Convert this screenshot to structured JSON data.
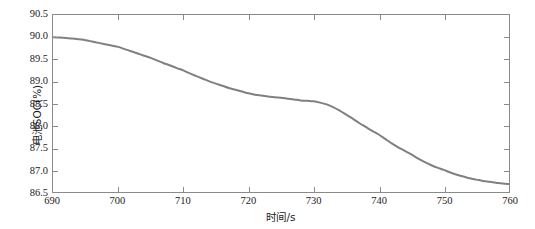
{
  "chart_data": {
    "type": "line",
    "title": "",
    "xlabel": "时间/s",
    "ylabel": "电池SOC(%)",
    "xlim": [
      690,
      760
    ],
    "ylim": [
      86.5,
      90.5
    ],
    "xticks": [
      690,
      700,
      710,
      720,
      730,
      740,
      750,
      760
    ],
    "xtick_labels": [
      "690",
      "700",
      "710",
      "720",
      "730",
      "740",
      "750",
      "760"
    ],
    "yticks": [
      86.5,
      87.0,
      87.5,
      88.0,
      88.5,
      89.0,
      89.5,
      90.0,
      90.5
    ],
    "ytick_labels": [
      "86.5",
      "87.0",
      "87.5",
      "88.0",
      "88.5",
      "89.0",
      "89.5",
      "90.0",
      "90.5"
    ],
    "grid": false,
    "legend": null,
    "legend_position": "none",
    "line_color": "#808080",
    "line_width": 2.0,
    "axis_color": "#8a8a8a",
    "background_color": "#ffffff",
    "series": [
      {
        "name": "电池SOC",
        "x": [
          690,
          691,
          692,
          693,
          694,
          695,
          696,
          697,
          698,
          699,
          700,
          701,
          702,
          703,
          704,
          705,
          706,
          707,
          708,
          709,
          710,
          711,
          712,
          713,
          714,
          715,
          716,
          717,
          718,
          719,
          720,
          721,
          722,
          723,
          724,
          725,
          726,
          727,
          728,
          729,
          730,
          731,
          732,
          733,
          734,
          735,
          736,
          737,
          738,
          739,
          740,
          741,
          742,
          743,
          744,
          745,
          746,
          747,
          748,
          749,
          750,
          751,
          752,
          753,
          754,
          755,
          756,
          757,
          758,
          759,
          760
        ],
        "y": [
          90.0,
          89.99,
          89.98,
          89.97,
          89.95,
          89.93,
          89.9,
          89.87,
          89.84,
          89.81,
          89.78,
          89.73,
          89.68,
          89.63,
          89.58,
          89.53,
          89.47,
          89.41,
          89.36,
          89.3,
          89.25,
          89.18,
          89.12,
          89.06,
          89.0,
          88.95,
          88.9,
          88.85,
          88.81,
          88.77,
          88.73,
          88.7,
          88.68,
          88.66,
          88.64,
          88.63,
          88.61,
          88.59,
          88.57,
          88.56,
          88.55,
          88.52,
          88.48,
          88.42,
          88.34,
          88.25,
          88.16,
          88.06,
          87.97,
          87.88,
          87.8,
          87.7,
          87.6,
          87.51,
          87.43,
          87.35,
          87.26,
          87.18,
          87.11,
          87.05,
          87.0,
          86.94,
          86.89,
          86.85,
          86.81,
          86.78,
          86.75,
          86.73,
          86.71,
          86.69,
          86.68
        ]
      }
    ]
  }
}
